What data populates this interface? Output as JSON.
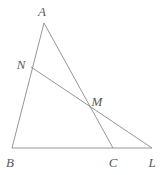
{
  "figure": {
    "type": "geometry-diagram",
    "title": "",
    "background_color": "#ffffff",
    "stroke_color": "#8a8a8a",
    "label_color": "#5a5a5a",
    "stroke_width": 0.9,
    "width": 164,
    "height": 175
  },
  "points": [
    {
      "id": "A",
      "label": "A",
      "x": 44,
      "y": 23,
      "label_x": 42,
      "label_y": 11
    },
    {
      "id": "N",
      "label": "N",
      "x": 31,
      "y": 67,
      "label_x": 21,
      "label_y": 64
    },
    {
      "id": "M",
      "label": "M",
      "x": 88,
      "y": 112,
      "label_x": 97,
      "label_y": 101
    },
    {
      "id": "B",
      "label": "B",
      "x": 12,
      "y": 148,
      "label_x": 10,
      "label_y": 162
    },
    {
      "id": "C",
      "label": "C",
      "x": 113,
      "y": 148,
      "label_x": 113,
      "label_y": 162
    },
    {
      "id": "L",
      "label": "L",
      "x": 152,
      "y": 148,
      "label_x": 152,
      "label_y": 162
    }
  ],
  "segments": [
    {
      "id": "AB",
      "name": "segment-ab",
      "from": "A",
      "to": "B"
    },
    {
      "id": "AC",
      "name": "segment-ac",
      "from": "A",
      "to": "C"
    },
    {
      "id": "BL",
      "name": "segment-bl",
      "from": "B",
      "to": "L"
    },
    {
      "id": "NL",
      "name": "segment-nl",
      "from": "N",
      "to": "L"
    }
  ]
}
